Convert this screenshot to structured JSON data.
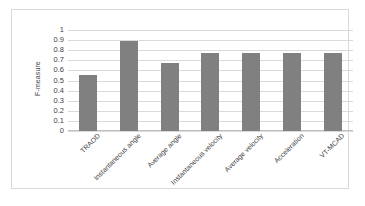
{
  "chart_data": {
    "type": "bar",
    "title": "",
    "xlabel": "",
    "ylabel": "F-measure",
    "ylim": [
      0,
      1
    ],
    "grid": true,
    "legend": "none",
    "bar_color": "#808080",
    "categories": [
      "TRAOD",
      "Instantaneous angle",
      "Average angle",
      "Instantaneous velocity",
      "Average velocity",
      "Acceleration",
      "VT-MCAD"
    ],
    "values": [
      0.55,
      0.89,
      0.67,
      0.77,
      0.77,
      0.77,
      0.77
    ],
    "ytick_labels": [
      "1",
      "0.9",
      "0.8",
      "0.7",
      "0.6",
      "0.5",
      "0.4",
      "0.3",
      "0.2",
      "0.1",
      "0"
    ],
    "ytick_values": [
      1,
      0.9,
      0.8,
      0.7,
      0.6,
      0.5,
      0.4,
      0.3,
      0.2,
      0.1,
      0
    ]
  },
  "colors": {
    "bar": "#808080",
    "gridline": "#dadada",
    "frame": "#d9d9d9",
    "text": "#3f3f3f"
  }
}
